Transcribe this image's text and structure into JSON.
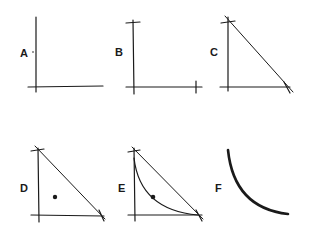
{
  "panels": [
    {
      "id": "A",
      "label": "A",
      "description": "Empty axes with a single small point near the y-axis"
    },
    {
      "id": "B",
      "label": "B",
      "description": "Axes with tick marks at maximum of each axis"
    },
    {
      "id": "C",
      "label": "C",
      "description": "Axes with straight line connecting the two axis endpoints"
    },
    {
      "id": "D",
      "label": "D",
      "description": "Triangle frontier with an interior point"
    },
    {
      "id": "E",
      "label": "E",
      "description": "Triangle frontier with a convex curve passing through a point"
    },
    {
      "id": "F",
      "label": "F",
      "description": "Thick convex curve alone"
    }
  ],
  "colors": {
    "ink": "#1a1a1a",
    "background": "#ffffff"
  }
}
